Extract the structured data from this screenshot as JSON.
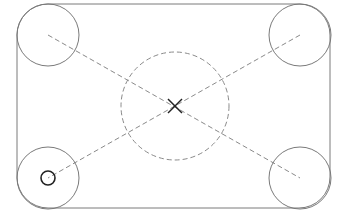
{
  "diagram": {
    "canvas": {
      "width": 345,
      "height": 218,
      "background": "#ffffff"
    },
    "colors": {
      "outline": "#7a7a7a",
      "dashed": "#8a8a8a",
      "marker": "#222222",
      "hole": "#222222"
    },
    "plate": {
      "x": 17,
      "y": 4,
      "width": 313,
      "height": 204,
      "corner_radius": 31
    },
    "corner_circles": [
      {
        "id": "top-left",
        "cx": 48,
        "cy": 35,
        "r": 31
      },
      {
        "id": "top-right",
        "cx": 300,
        "cy": 35,
        "r": 31
      },
      {
        "id": "bottom-left",
        "cx": 48,
        "cy": 178,
        "r": 31
      },
      {
        "id": "bottom-right",
        "cx": 300,
        "cy": 178,
        "r": 31
      }
    ],
    "center_circle": {
      "cx": 175,
      "cy": 106,
      "r": 54,
      "dashed": true
    },
    "diagonals": [
      {
        "x1": 48,
        "y1": 35,
        "x2": 300,
        "y2": 178
      },
      {
        "x1": 300,
        "y1": 35,
        "x2": 48,
        "y2": 178
      }
    ],
    "center_marker": {
      "cx": 175,
      "cy": 106,
      "size": 7,
      "shape": "x"
    },
    "small_hole": {
      "cx": 48,
      "cy": 178,
      "r": 7
    }
  }
}
